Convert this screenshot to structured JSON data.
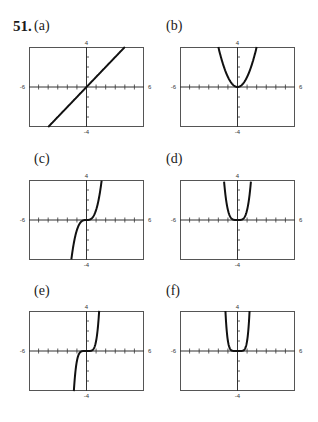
{
  "problem_number": "51.",
  "panels": [
    {
      "label": "(a)",
      "func": "x",
      "left": 29,
      "top": 47,
      "label_left": 34,
      "label_top": 18
    },
    {
      "label": "(b)",
      "func": "x^2",
      "left": 180,
      "top": 47,
      "label_left": 166,
      "label_top": 18
    },
    {
      "label": "(c)",
      "func": "x^3",
      "left": 29,
      "top": 180,
      "label_left": 34,
      "label_top": 151
    },
    {
      "label": "(d)",
      "func": "x^4",
      "left": 180,
      "top": 180,
      "label_left": 166,
      "label_top": 151
    },
    {
      "label": "(e)",
      "func": "x^5",
      "left": 29,
      "top": 311,
      "label_left": 34,
      "label_top": 283
    },
    {
      "label": "(f)",
      "func": "x^6",
      "left": 180,
      "top": 311,
      "label_left": 166,
      "label_top": 283
    }
  ],
  "axis": {
    "xmin_label": "-6",
    "xmax_label": "6",
    "ymin_label": "-4",
    "ymax_label": "4"
  },
  "chart_data": [
    {
      "type": "line",
      "title": "(a)",
      "expression": "y = x",
      "xlim": [
        -6,
        6
      ],
      "ylim": [
        -4,
        4
      ],
      "x": [
        -4,
        -2,
        0,
        2,
        4
      ],
      "y": [
        -4,
        -2,
        0,
        2,
        4
      ],
      "grid": false,
      "xticks_every": 1,
      "yticks_every": 1
    },
    {
      "type": "line",
      "title": "(b)",
      "expression": "y = x^2",
      "xlim": [
        -6,
        6
      ],
      "ylim": [
        -4,
        4
      ],
      "x": [
        -2,
        -1,
        0,
        1,
        2
      ],
      "y": [
        4,
        1,
        0,
        1,
        4
      ],
      "grid": false,
      "xticks_every": 1,
      "yticks_every": 1
    },
    {
      "type": "line",
      "title": "(c)",
      "expression": "y = x^3",
      "xlim": [
        -6,
        6
      ],
      "ylim": [
        -4,
        4
      ],
      "x": [
        -1.587,
        -1,
        0,
        1,
        1.587
      ],
      "y": [
        -4,
        -1,
        0,
        1,
        4
      ],
      "grid": false,
      "xticks_every": 1,
      "yticks_every": 1
    },
    {
      "type": "line",
      "title": "(d)",
      "expression": "y = x^4",
      "xlim": [
        -6,
        6
      ],
      "ylim": [
        -4,
        4
      ],
      "x": [
        -1.414,
        -1,
        0,
        1,
        1.414
      ],
      "y": [
        4,
        1,
        0,
        1,
        4
      ],
      "grid": false,
      "xticks_every": 1,
      "yticks_every": 1
    },
    {
      "type": "line",
      "title": "(e)",
      "expression": "y = x^5",
      "xlim": [
        -6,
        6
      ],
      "ylim": [
        -4,
        4
      ],
      "x": [
        -1.32,
        -1,
        0,
        1,
        1.32
      ],
      "y": [
        -4,
        -1,
        0,
        1,
        4
      ],
      "grid": false,
      "xticks_every": 1,
      "yticks_every": 1
    },
    {
      "type": "line",
      "title": "(f)",
      "expression": "y = x^6",
      "xlim": [
        -6,
        6
      ],
      "ylim": [
        -4,
        4
      ],
      "x": [
        -1.26,
        -1,
        0,
        1,
        1.26
      ],
      "y": [
        4,
        1,
        0,
        1,
        4
      ],
      "grid": false,
      "xticks_every": 1,
      "yticks_every": 1
    }
  ]
}
